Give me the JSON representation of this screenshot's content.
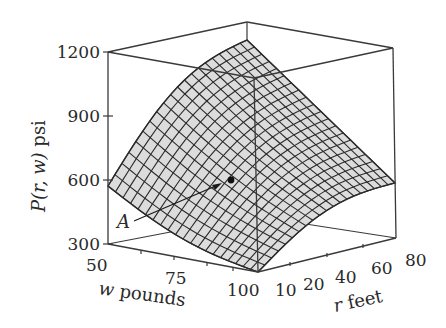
{
  "chart_data": {
    "type": "surface3d",
    "title": "",
    "zlabel": "P(r, w) psi",
    "xlabel": "w pounds",
    "ylabel": "r feet",
    "z_ticks": [
      "300",
      "600",
      "900",
      "1200"
    ],
    "w_ticks": [
      "50",
      "75",
      "100"
    ],
    "r_ticks": [
      "10",
      "20",
      "40",
      "60",
      "80"
    ],
    "zlim": [
      300,
      1200
    ],
    "wlim": [
      50,
      100
    ],
    "rlim": [
      0,
      80
    ],
    "surface_corners": [
      {
        "w": 50,
        "r": 80,
        "P": 1150,
        "note": "back peak"
      },
      {
        "w": 50,
        "r": 0,
        "P": 560
      },
      {
        "w": 100,
        "r": 0,
        "P": 300
      },
      {
        "w": 100,
        "r": 80,
        "P": 600
      }
    ],
    "annotation": {
      "label": "A",
      "w": 75,
      "r": 40,
      "P": 620
    },
    "grid_resolution": 20,
    "surface_fill": "#dcdcdc",
    "mesh_color": "#2b2b2b",
    "box_color": "#3a3a3a"
  },
  "labels": {
    "z_axis": "P(r, w) psi",
    "z_axis_italic_part": "P(r, w)",
    "z_axis_unit": " psi",
    "w_axis_var": "w",
    "w_axis_unit": " pounds",
    "r_axis_var": "r",
    "r_axis_unit": " feet",
    "point_label": "A"
  }
}
